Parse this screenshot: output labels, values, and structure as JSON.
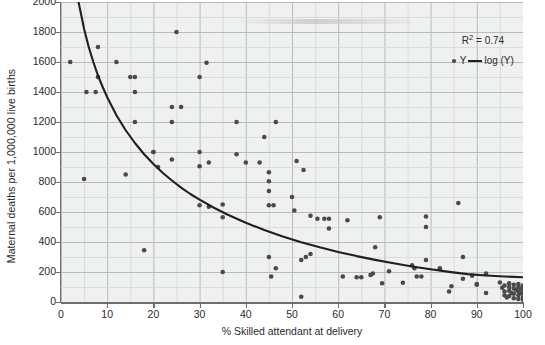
{
  "chart_data": {
    "type": "scatter",
    "title": "",
    "xlabel": "% Skilled attendant at delivery",
    "ylabel": "Maternal deaths per 1,000,000 live births",
    "xlim": [
      0,
      100
    ],
    "ylim": [
      0,
      2000
    ],
    "xticks": [
      0,
      10,
      20,
      30,
      40,
      50,
      60,
      70,
      80,
      90,
      100
    ],
    "yticks": [
      0,
      200,
      400,
      600,
      800,
      1000,
      1200,
      1400,
      1600,
      1800,
      2000
    ],
    "grid": true,
    "grid_minor_x_step": 5,
    "grid_minor_y_step": 100,
    "legend_position": "top-right",
    "annotations": [
      {
        "text": "R2 = 0.74",
        "display": "R² = 0.74"
      }
    ],
    "series": [
      {
        "name": "Y",
        "type": "scatter",
        "marker": "circle",
        "color": "#4a4a4a",
        "points": [
          [
            2,
            1600
          ],
          [
            5,
            820
          ],
          [
            5.5,
            1400
          ],
          [
            7.5,
            1400
          ],
          [
            8,
            1700
          ],
          [
            8,
            1500
          ],
          [
            12,
            1600
          ],
          [
            14,
            850
          ],
          [
            15,
            1500
          ],
          [
            16,
            1500
          ],
          [
            16,
            1400
          ],
          [
            16,
            1200
          ],
          [
            18,
            345
          ],
          [
            20,
            1000
          ],
          [
            20,
            1000
          ],
          [
            21,
            900
          ],
          [
            24,
            1300
          ],
          [
            24,
            1200
          ],
          [
            24,
            950
          ],
          [
            25,
            1800
          ],
          [
            26,
            1300
          ],
          [
            30,
            1500
          ],
          [
            30,
            1000
          ],
          [
            30,
            905
          ],
          [
            30,
            645
          ],
          [
            31.5,
            1595
          ],
          [
            32,
            635
          ],
          [
            32,
            930
          ],
          [
            35,
            650
          ],
          [
            35,
            565
          ],
          [
            35,
            200
          ],
          [
            38,
            1200
          ],
          [
            38,
            985
          ],
          [
            40,
            930
          ],
          [
            43,
            930
          ],
          [
            44,
            1100
          ],
          [
            45,
            740
          ],
          [
            45,
            805
          ],
          [
            45,
            865
          ],
          [
            45,
            645
          ],
          [
            45,
            300
          ],
          [
            45.5,
            170
          ],
          [
            46,
            645
          ],
          [
            46.5,
            1200
          ],
          [
            46.5,
            225
          ],
          [
            50,
            700
          ],
          [
            50.5,
            610
          ],
          [
            51,
            940
          ],
          [
            52,
            35
          ],
          [
            52,
            280
          ],
          [
            52.5,
            880
          ],
          [
            53,
            300
          ],
          [
            54,
            575
          ],
          [
            54,
            320
          ],
          [
            55.5,
            555
          ],
          [
            57,
            555
          ],
          [
            58,
            555
          ],
          [
            58,
            490
          ],
          [
            61,
            170
          ],
          [
            62,
            545
          ],
          [
            64,
            165
          ],
          [
            65,
            165
          ],
          [
            67,
            180
          ],
          [
            67.5,
            190
          ],
          [
            68,
            365
          ],
          [
            69,
            565
          ],
          [
            69.5,
            125
          ],
          [
            71,
            205
          ],
          [
            74,
            128
          ],
          [
            76,
            245
          ],
          [
            76.5,
            225
          ],
          [
            77,
            170
          ],
          [
            78,
            170
          ],
          [
            79,
            570
          ],
          [
            79,
            500
          ],
          [
            79,
            280
          ],
          [
            82,
            225
          ],
          [
            82,
            220
          ],
          [
            84,
            70
          ],
          [
            84.5,
            105
          ],
          [
            86,
            660
          ],
          [
            87,
            300
          ],
          [
            87,
            155
          ],
          [
            89,
            175
          ],
          [
            90,
            120
          ],
          [
            90,
            115
          ],
          [
            92,
            190
          ],
          [
            92,
            60
          ],
          [
            95,
            130
          ],
          [
            95.5,
            95
          ],
          [
            96,
            110
          ],
          [
            96,
            70
          ],
          [
            96,
            45
          ],
          [
            96.5,
            30
          ],
          [
            97,
            125
          ],
          [
            97,
            100
          ],
          [
            97,
            75
          ],
          [
            97,
            40
          ],
          [
            97.5,
            60
          ],
          [
            98,
            115
          ],
          [
            98,
            90
          ],
          [
            98,
            55
          ],
          [
            98,
            25
          ],
          [
            98.5,
            80
          ],
          [
            99,
            120
          ],
          [
            99,
            100
          ],
          [
            99,
            70
          ],
          [
            99,
            45
          ],
          [
            99,
            20
          ],
          [
            99.5,
            90
          ],
          [
            99.5,
            60
          ],
          [
            100,
            110
          ],
          [
            100,
            85
          ],
          [
            100,
            55
          ],
          [
            100,
            30
          ],
          [
            100,
            15
          ]
        ]
      },
      {
        "name": "log (Y)",
        "type": "line",
        "color": "#1f1f1f",
        "fit": "logarithmic",
        "description": "Fitted logarithmic trend line decreasing from about 2000 near x=4 to about 165 at x=100",
        "points": [
          [
            3.8,
            2000
          ],
          [
            5,
            1820
          ],
          [
            6,
            1700
          ],
          [
            7,
            1600
          ],
          [
            8,
            1510
          ],
          [
            9,
            1435
          ],
          [
            10,
            1365
          ],
          [
            12,
            1245
          ],
          [
            14,
            1145
          ],
          [
            16,
            1060
          ],
          [
            18,
            985
          ],
          [
            20,
            920
          ],
          [
            22,
            862
          ],
          [
            24,
            810
          ],
          [
            26,
            763
          ],
          [
            28,
            720
          ],
          [
            30,
            682
          ],
          [
            33,
            630
          ],
          [
            36,
            583
          ],
          [
            40,
            528
          ],
          [
            44,
            480
          ],
          [
            48,
            437
          ],
          [
            52,
            399
          ],
          [
            56,
            365
          ],
          [
            60,
            334
          ],
          [
            64,
            306
          ],
          [
            68,
            281
          ],
          [
            72,
            258
          ],
          [
            76,
            237
          ],
          [
            80,
            218
          ],
          [
            84,
            201
          ],
          [
            88,
            186
          ],
          [
            92,
            177
          ],
          [
            96,
            170
          ],
          [
            100,
            165
          ]
        ]
      }
    ]
  },
  "legend": {
    "r2_label": "R² = 0.74",
    "series_scatter_label": "Y",
    "series_line_label": "log (Y)"
  },
  "axes": {
    "x_title": "% Skilled attendant at delivery",
    "y_title": "Maternal deaths per 1,000,000 live births"
  },
  "colors": {
    "plot_background": "#eff0f0",
    "grid_major": "#b9bbbb",
    "grid_minor": "#d8d9d9",
    "axis": "#6e6e6e",
    "marker": "#4a4a4a",
    "fit_line": "#1f1f1f",
    "text": "#2b2b2b"
  }
}
